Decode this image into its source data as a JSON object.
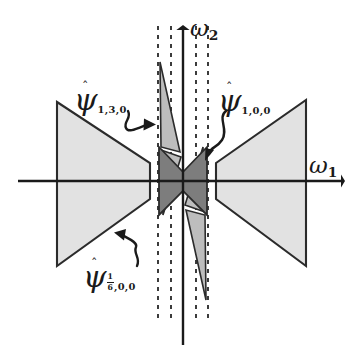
{
  "figure": {
    "type": "wavelet-frequency-tiling-diagram",
    "background_color": "#ffffff",
    "line_color": "#1a1a1a",
    "light_fill": "#e2e2e2",
    "dark_fill": "#7d7d7d",
    "mid_fill": "#b9b9b9"
  },
  "axes": {
    "horizontal": {
      "name": "omega-1-axis",
      "label": "ω",
      "subscript": "1",
      "direction": "right",
      "y": 181,
      "x_start": 18,
      "x_end": 345
    },
    "vertical": {
      "name": "omega-2-axis",
      "label": "ω",
      "subscript": "2",
      "direction": "up",
      "x": 183,
      "y_start": 345,
      "y_end": 26
    }
  },
  "labels": {
    "psi_1_3_0": {
      "glyph": "ψ",
      "hat": "ˆ",
      "subscript": "1,3,0",
      "arrow": "curved-arrow-right"
    },
    "psi_1_0_0": {
      "glyph": "ψ",
      "hat": "ˆ",
      "subscript": "1,0,0",
      "arrow": "curved-arrow-down-left"
    },
    "psi_onesixth_0_0": {
      "glyph": "ψ",
      "hat": "ˆ",
      "subscript_fraction_numerator": "1",
      "subscript_fraction_denominator": "6",
      "subscript_tail": ",0,0",
      "arrow": "curved-arrow-up-left"
    },
    "omega_1": {
      "glyph": "ω",
      "subscript": "1"
    },
    "omega_2": {
      "glyph": "ω",
      "subscript": "2"
    }
  },
  "shapes": {
    "left_trapezoid": {
      "name": "left-light-trapezoid",
      "fill": "#e2e2e2",
      "points": "57,102 150,163 150,199 57,266"
    },
    "right_trapezoid": {
      "name": "right-light-trapezoid",
      "fill": "#e2e2e2",
      "points": "216,163 306,100 306,266 216,199"
    },
    "left_dark_wedge": {
      "name": "left-dark-wedge",
      "fill": "#7d7d7d",
      "points": "159,148 183,172 183,191 159,214"
    },
    "right_dark_wedge": {
      "name": "right-dark-wedge",
      "fill": "#7d7d7d",
      "points": "207,148 183,172 183,191 207,214"
    },
    "upper_sliver": {
      "name": "upper-light-sliver",
      "fill": "#bdbdbd",
      "points": "160,62 180,152 162,146"
    },
    "lower_sliver": {
      "name": "lower-light-sliver",
      "fill": "#bdbdbd",
      "points": "206,300 186,210 204,216"
    }
  },
  "dashed_lines": {
    "name": "dashed-frequency-guides",
    "x_positions": [
      158,
      171,
      196,
      208
    ],
    "y_top": 26,
    "y_bottom": 318,
    "dash_pattern": "4 5"
  }
}
